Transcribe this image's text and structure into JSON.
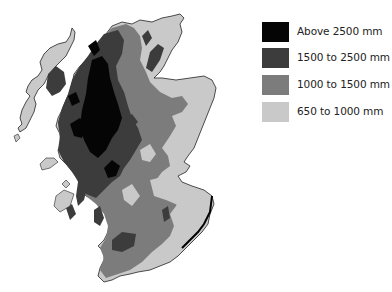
{
  "map": {
    "title_fragment": "",
    "subject": "Average annual rainfall, Scotland",
    "colors": {
      "above_2500": "#050505",
      "1500_2500": "#3c3c3c",
      "1000_1500": "#7c7c7c",
      "650_1000": "#c9c9c9",
      "coast": "#111111",
      "background": "#ffffff"
    }
  },
  "legend": {
    "items": [
      {
        "label": "Above 2500 mm",
        "color": "#050505"
      },
      {
        "label": "1500 to 2500 mm",
        "color": "#3c3c3c"
      },
      {
        "label": "1000 to 1500 mm",
        "color": "#7c7c7c"
      },
      {
        "label": "650 to 1000 mm",
        "color": "#c9c9c9"
      }
    ]
  }
}
